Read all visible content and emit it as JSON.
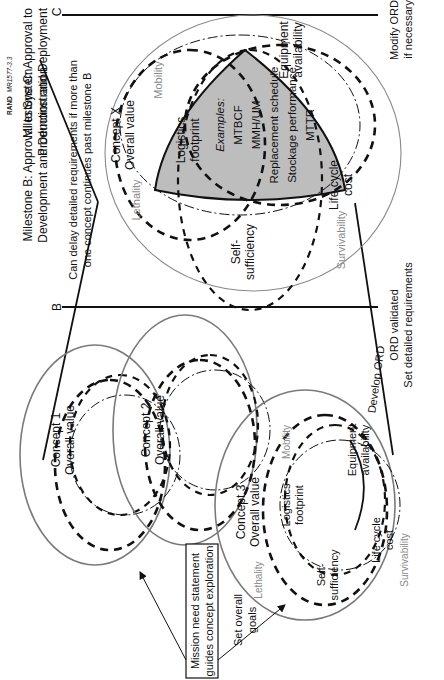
{
  "credit": {
    "brand": "RAND",
    "code": "MR1577-3.3"
  },
  "milestones": {
    "c": {
      "title_line1": "Milestone C: Approval to",
      "title_line2": "Production and Deployment",
      "letter": "C"
    },
    "b": {
      "title_line1": "Milestone B: Approval to System",
      "title_line2": "Development and Demonstration",
      "letter": "B"
    }
  },
  "notes": {
    "delay_line1": "Can delay detailed requirements if more than",
    "delay_line2": "one concept continues past milestone B",
    "modify_line1": "Modify ORD",
    "modify_line2": "if necessary",
    "develop_ord": "Develop ORD",
    "ord_validated": "ORD validated",
    "set_detailed": "Set detailed requirements",
    "set_overall_line1": "Set overall",
    "set_overall_line2": "goals"
  },
  "mission_box": {
    "line1": "Mission need statement",
    "line2": "guides concept exploration"
  },
  "concepts": [
    {
      "name": "Concept 1",
      "sub": "Overall value"
    },
    {
      "name": "Concept 2",
      "sub": "Overall value"
    },
    {
      "name": "Concept 3",
      "sub": "Overall value"
    },
    {
      "name": "Concept X",
      "sub": "Overall value"
    }
  ],
  "attributes": {
    "mobility": "Mobility",
    "lethality": "Lethality",
    "survivability": "Survivability",
    "logistics_line1": "Logistics",
    "logistics_line2": "footprint",
    "equipment_line1": "Equipment",
    "equipment_line2": "availability",
    "self_line1": "Self-",
    "self_line2": "sufficiency",
    "lifecycle_line1": "Life cycle",
    "lifecycle_line2": "cost"
  },
  "examples": {
    "label": "Examples:",
    "items": [
      "MTBCF",
      "MMH/UM",
      "Replacement schedule",
      "Stockage performance",
      "MTTR"
    ]
  },
  "colors": {
    "shaded": "#bdbdbd",
    "ellipse": "#7a7a7a",
    "gray_text": "#8a8a8a"
  }
}
